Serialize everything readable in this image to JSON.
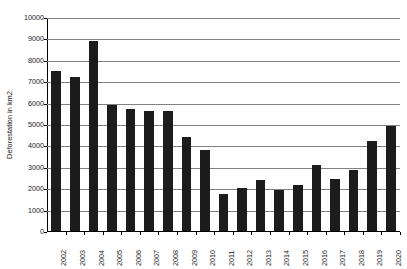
{
  "chart_data": {
    "type": "bar",
    "title": "",
    "xlabel": "",
    "ylabel": "Deforestation in km2",
    "ylim": [
      0,
      10000
    ],
    "ytick_labels": [
      "0",
      "1000",
      "2000",
      "3000",
      "4000",
      "5000",
      "6000",
      "7000",
      "8000",
      "9000",
      "10000"
    ],
    "ytick_values": [
      0,
      1000,
      2000,
      3000,
      4000,
      5000,
      6000,
      7000,
      8000,
      9000,
      10000
    ],
    "grid": true,
    "legend": false,
    "bar_color": "#1c1c1c",
    "gridline_color": "#808080",
    "axis_color": "#000000",
    "categories": [
      "2002",
      "2003",
      "2004",
      "2005",
      "2006",
      "2007",
      "2008",
      "2009",
      "2010",
      "2011",
      "2012",
      "2013",
      "2014",
      "2015",
      "2016",
      "2017",
      "2018",
      "2019",
      "2020"
    ],
    "values": [
      7500,
      7200,
      8900,
      5900,
      5700,
      5600,
      5600,
      4400,
      3800,
      1750,
      2000,
      2400,
      1900,
      2150,
      3100,
      2450,
      2850,
      4200,
      4900
    ]
  }
}
